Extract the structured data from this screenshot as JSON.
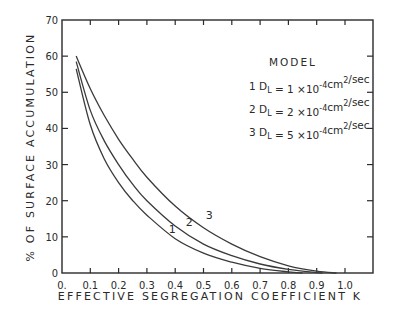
{
  "chart_data": {
    "type": "line",
    "title": "",
    "xlabel": "EFFECTIVE SEGREGATION COEFFICIENT K",
    "ylabel": "% OF SURFACE ACCUMULATION",
    "xlim": [
      0,
      1.1
    ],
    "ylim": [
      0,
      70
    ],
    "x_ticks": [
      0,
      0.1,
      0.2,
      0.3,
      0.4,
      0.5,
      0.6,
      0.7,
      0.8,
      0.9,
      1.0
    ],
    "x_tick_labels": [
      "0.",
      "0.1",
      "0.2",
      "0.3",
      "0.4",
      "0.5",
      "0.6",
      "0.7",
      "0.8",
      "0.9",
      "1.0"
    ],
    "y_ticks": [
      0,
      10,
      20,
      30,
      40,
      50,
      60,
      70
    ],
    "y_tick_labels": [
      "0",
      "10",
      "20",
      "30",
      "40",
      "50",
      "60",
      "70"
    ],
    "grid": false,
    "legend": {
      "position": "upper right",
      "title": "MODEL",
      "entries": [
        {
          "id": "1",
          "symbol": "D",
          "subscript": "L",
          "equals": "=",
          "coef": "1",
          "times": "×10",
          "exp": "-4",
          "unit": "cm",
          "unit_exp": "2",
          "unit_tail": "/sec"
        },
        {
          "id": "2",
          "symbol": "D",
          "subscript": "L",
          "equals": "=",
          "coef": "2",
          "times": "×10",
          "exp": "-4",
          "unit": "cm",
          "unit_exp": "2",
          "unit_tail": "/sec"
        },
        {
          "id": "3",
          "symbol": "D",
          "subscript": "L",
          "equals": "=",
          "coef": "5",
          "times": "×10",
          "exp": "-4",
          "unit": "cm",
          "unit_exp": "2",
          "unit_tail": "/sec"
        }
      ]
    },
    "series": [
      {
        "name": "1",
        "label": "D_L = 1x10^-4 cm^2/sec",
        "x": [
          0.05,
          0.1,
          0.15,
          0.2,
          0.25,
          0.3,
          0.4,
          0.5,
          0.6,
          0.7,
          0.8,
          0.85
        ],
        "values": [
          56.5,
          41,
          31.5,
          25,
          20,
          16,
          9.5,
          5.5,
          3,
          1.3,
          0.3,
          0
        ]
      },
      {
        "name": "2",
        "label": "D_L = 2x10^-4 cm^2/sec",
        "x": [
          0.05,
          0.1,
          0.15,
          0.2,
          0.25,
          0.3,
          0.4,
          0.5,
          0.6,
          0.7,
          0.8,
          0.9,
          0.92
        ],
        "values": [
          58.5,
          45,
          36.5,
          30,
          24.5,
          20,
          13,
          8,
          4.8,
          2.5,
          1,
          0.1,
          0
        ]
      },
      {
        "name": "3",
        "label": "D_L = 5x10^-4 cm^2/sec",
        "x": [
          0.05,
          0.1,
          0.15,
          0.2,
          0.25,
          0.3,
          0.4,
          0.5,
          0.6,
          0.7,
          0.8,
          0.9,
          0.97
        ],
        "values": [
          60,
          51,
          43.5,
          37,
          31.5,
          26.5,
          18.5,
          12.5,
          8,
          4.5,
          2,
          0.5,
          0
        ]
      }
    ],
    "annotations": [
      {
        "text": "1",
        "x": 0.39,
        "y": 11
      },
      {
        "text": "2",
        "x": 0.45,
        "y": 13
      },
      {
        "text": "3",
        "x": 0.52,
        "y": 15
      }
    ],
    "colors": {
      "line": "#3a3a3a",
      "axis": "#2a2a2a",
      "background": "#ffffff"
    }
  }
}
